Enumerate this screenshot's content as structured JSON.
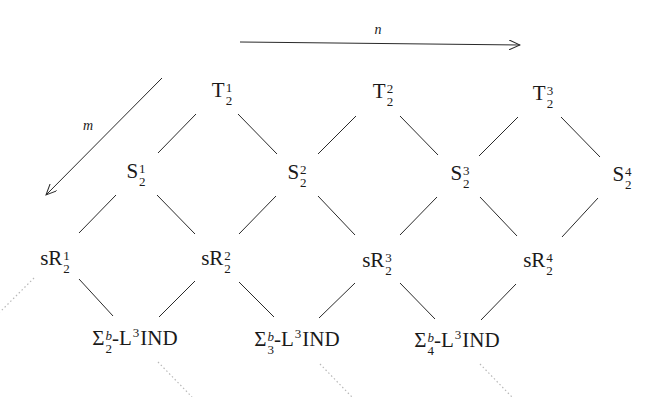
{
  "axes": {
    "n": {
      "label": "n",
      "direction": "right"
    },
    "m": {
      "label": "m",
      "direction": "down-left"
    }
  },
  "rows": {
    "T": [
      {
        "base": "T",
        "sup": "1",
        "sub": "2"
      },
      {
        "base": "T",
        "sup": "2",
        "sub": "2"
      },
      {
        "base": "T",
        "sup": "3",
        "sub": "2"
      }
    ],
    "S": [
      {
        "base": "S",
        "sup": "1",
        "sub": "2"
      },
      {
        "base": "S",
        "sup": "2",
        "sub": "2"
      },
      {
        "base": "S",
        "sup": "3",
        "sub": "2"
      },
      {
        "base": "S",
        "sup": "4",
        "sub": "2"
      }
    ],
    "sR": [
      {
        "base": "sR",
        "sup": "1",
        "sub": "2"
      },
      {
        "base": "sR",
        "sup": "2",
        "sub": "2"
      },
      {
        "base": "sR",
        "sup": "3",
        "sub": "2"
      },
      {
        "base": "sR",
        "sup": "4",
        "sub": "2"
      }
    ],
    "Sigma": [
      {
        "base": "Σ",
        "sup": "b",
        "sub": "2",
        "mid": "-L",
        "mid_sup": "3",
        "tail": "IND"
      },
      {
        "base": "Σ",
        "sup": "b",
        "sub": "3",
        "mid": "-L",
        "mid_sup": "3",
        "tail": "IND"
      },
      {
        "base": "Σ",
        "sup": "b",
        "sub": "4",
        "mid": "-L",
        "mid_sup": "3",
        "tail": "IND"
      }
    ]
  },
  "colors": {
    "line": "#2a2a2a",
    "dotted": "#b8b8b8",
    "text": "#1a1a1a"
  }
}
